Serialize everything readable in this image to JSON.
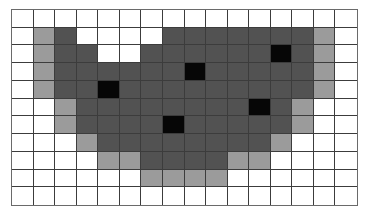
{
  "figure": {
    "type": "pixel-grid",
    "columns": 16,
    "rows": 11,
    "legend_levels": {
      "0": {
        "name": "white",
        "color": "#ffffff"
      },
      "1": {
        "name": "light-gray",
        "color": "#9b9b9b"
      },
      "2": {
        "name": "dark-gray",
        "color": "#525252"
      },
      "3": {
        "name": "black",
        "color": "#060606"
      }
    },
    "cells": [
      [
        0,
        0,
        0,
        0,
        0,
        0,
        0,
        0,
        0,
        0,
        0,
        0,
        0,
        0,
        0,
        0
      ],
      [
        0,
        1,
        2,
        0,
        0,
        0,
        0,
        2,
        2,
        2,
        2,
        2,
        2,
        2,
        1,
        0
      ],
      [
        0,
        1,
        2,
        2,
        0,
        0,
        2,
        2,
        2,
        2,
        2,
        2,
        3,
        2,
        1,
        0
      ],
      [
        0,
        1,
        2,
        2,
        2,
        2,
        2,
        2,
        3,
        2,
        2,
        2,
        2,
        2,
        1,
        0
      ],
      [
        0,
        1,
        2,
        2,
        3,
        2,
        2,
        2,
        2,
        2,
        2,
        2,
        2,
        2,
        1,
        0
      ],
      [
        0,
        0,
        1,
        2,
        2,
        2,
        2,
        2,
        2,
        2,
        2,
        3,
        2,
        1,
        0,
        0
      ],
      [
        0,
        0,
        1,
        2,
        2,
        2,
        2,
        3,
        2,
        2,
        2,
        2,
        2,
        1,
        0,
        0
      ],
      [
        0,
        0,
        0,
        1,
        2,
        2,
        2,
        2,
        2,
        2,
        2,
        2,
        1,
        0,
        0,
        0
      ],
      [
        0,
        0,
        0,
        0,
        1,
        1,
        2,
        2,
        2,
        2,
        1,
        1,
        0,
        0,
        0,
        0
      ],
      [
        0,
        0,
        0,
        0,
        0,
        0,
        1,
        1,
        1,
        1,
        0,
        0,
        0,
        0,
        0,
        0
      ],
      [
        0,
        0,
        0,
        0,
        0,
        0,
        0,
        0,
        0,
        0,
        0,
        0,
        0,
        0,
        0,
        0
      ]
    ]
  }
}
